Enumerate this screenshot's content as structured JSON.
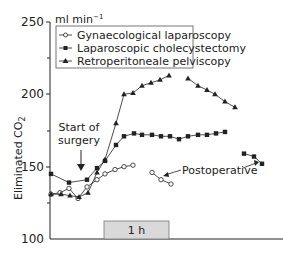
{
  "chart_data": {
    "type": "line",
    "title": "",
    "xlabel": "",
    "ylabel": "Eliminated CO2",
    "unit_label": "ml min⁻¹",
    "ylim": [
      100,
      250
    ],
    "yticks": [
      100,
      150,
      200,
      250
    ],
    "yminor_ticks": [
      125,
      175,
      225
    ],
    "grid": false,
    "legend_position": "top-left inside box",
    "series": [
      {
        "name": "Gynaecological laparoscopy",
        "marker": "open-circle",
        "segments": [
          {
            "label": "intraoperative",
            "points": [
              [
                51,
                131
              ],
              [
                60,
                132
              ],
              [
                69,
                135
              ],
              [
                78,
                128
              ],
              [
                87,
                136
              ],
              [
                97,
                141
              ],
              [
                105,
                145
              ],
              [
                115,
                148
              ],
              [
                124,
                150
              ],
              [
                133,
                151
              ]
            ]
          },
          {
            "label": "postoperative",
            "points": [
              [
                152,
                146
              ],
              [
                161,
                141
              ],
              [
                171,
                138
              ]
            ]
          }
        ]
      },
      {
        "name": "Laparoscopic cholecystectomy",
        "marker": "filled-square",
        "segments": [
          {
            "label": "intraoperative",
            "points": [
              [
                51,
                145
              ],
              [
                69,
                139
              ],
              [
                87,
                141
              ],
              [
                97,
                149
              ],
              [
                105,
                154
              ],
              [
                116,
                165
              ],
              [
                124,
                171
              ],
              [
                134,
                173
              ],
              [
                142,
                172
              ],
              [
                152,
                172
              ],
              [
                161,
                171
              ],
              [
                170,
                171
              ],
              [
                179,
                169
              ],
              [
                188,
                171
              ],
              [
                198,
                172
              ],
              [
                207,
                172
              ],
              [
                216,
                173
              ],
              [
                225,
                174
              ]
            ]
          },
          {
            "label": "postoperative",
            "points": [
              [
                244,
                159
              ],
              [
                254,
                157
              ],
              [
                262,
                152
              ]
            ]
          }
        ]
      },
      {
        "name": "Retroperitoneale pelviscopy",
        "marker": "filled-triangle",
        "segments": [
          {
            "label": "intraoperative",
            "points": [
              [
                51,
                131
              ],
              [
                61,
                131
              ],
              [
                70,
                130
              ],
              [
                79,
                129
              ],
              [
                88,
                132
              ],
              [
                97,
                146
              ],
              [
                105,
                155
              ],
              [
                116,
                180
              ],
              [
                124,
                200
              ],
              [
                133,
                201
              ],
              [
                142,
                206
              ],
              [
                151,
                208
              ],
              [
                160,
                210
              ],
              [
                169,
                213
              ]
            ]
          },
          {
            "label": "postoperative-continuation",
            "points": [
              [
                188,
                211
              ],
              [
                198,
                206
              ],
              [
                207,
                203
              ],
              [
                215,
                200
              ],
              [
                225,
                195
              ],
              [
                235,
                191
              ]
            ]
          }
        ]
      }
    ],
    "annotations": [
      {
        "text": "Start of surgery",
        "arrow_to_value": 135
      },
      {
        "text": "Postoperative",
        "arrows": 2
      },
      {
        "text": "1 h",
        "type": "time-scale bar"
      }
    ]
  },
  "legend": {
    "items": [
      {
        "label": "Gynaecological laparoscopy",
        "marker": "open-circle"
      },
      {
        "label": "Laparoscopic cholecystectomy",
        "marker": "filled-square"
      },
      {
        "label": "Retroperitoneale pelviscopy",
        "marker": "filled-triangle"
      }
    ]
  },
  "axis": {
    "y_label_main": "Eliminated CO",
    "y_label_sub": "2",
    "unit_main": "ml min",
    "unit_sup": "−1",
    "tick_labels": [
      "250",
      "200",
      "150",
      "100"
    ]
  },
  "annotations": {
    "start_line1": "Start of",
    "start_line2": "surgery",
    "postoperative": "Postoperative",
    "time_bar": "1 h"
  },
  "colors": {
    "ink": "#222222",
    "time_bar_fill": "#d9d9d9",
    "time_bar_stroke": "#777777"
  }
}
